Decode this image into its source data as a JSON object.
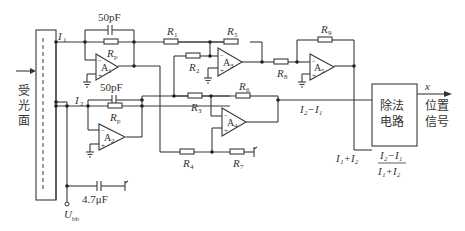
{
  "diagram": {
    "sensor": {
      "label_chars": [
        "受",
        "光",
        "面"
      ]
    },
    "currents": {
      "i1": "I",
      "i1_sub": "1",
      "i2": "I",
      "i2_sub": "2"
    },
    "capacitors": {
      "c1": "50pF",
      "c2": "50pF",
      "c3": "4.7μF"
    },
    "supply": {
      "label": "U",
      "sub": "bb"
    },
    "resistors": {
      "rp1": {
        "r": "R",
        "sub": "p"
      },
      "rp2": {
        "r": "R",
        "sub": "p"
      },
      "r1": {
        "r": "R",
        "sub": "1"
      },
      "r2": {
        "r": "R",
        "sub": "2"
      },
      "r3": {
        "r": "R",
        "sub": "3"
      },
      "r4": {
        "r": "R",
        "sub": "4"
      },
      "r5": {
        "r": "R",
        "sub": "5"
      },
      "r6": {
        "r": "R",
        "sub": "6"
      },
      "r7": {
        "r": "R",
        "sub": "7"
      },
      "r8": {
        "r": "R",
        "sub": "8"
      },
      "r9": {
        "r": "R",
        "sub": "9"
      }
    },
    "opamps": {
      "a1": {
        "label": "A",
        "sub": "1"
      },
      "a2": {
        "label": "A",
        "sub": "2"
      },
      "a3": {
        "label": "A",
        "sub": "3"
      },
      "a4": {
        "label": "A",
        "sub": "4"
      },
      "a5": {
        "label": "A",
        "sub": "5"
      }
    },
    "signals": {
      "diff": "I₂−I₁",
      "sum": "I₁+I₂",
      "ratio_num": "I₂−I₁",
      "ratio_den": "I₁+I₂"
    },
    "divider": {
      "line1": "除法",
      "line2": "电路"
    },
    "output": {
      "var": "x",
      "line1": "位置",
      "line2": "信号"
    }
  }
}
